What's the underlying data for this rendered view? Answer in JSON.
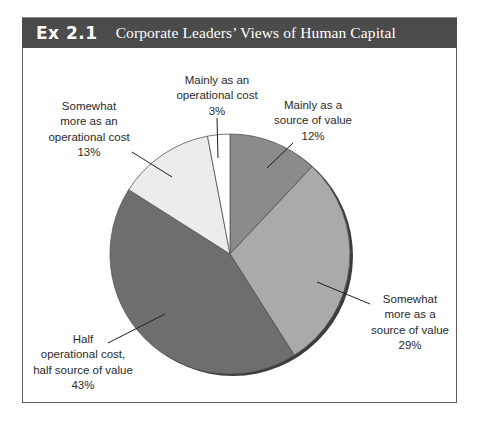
{
  "exhibit": {
    "number": "Ex 2.1",
    "title": "Corporate Leaders’ Views of Human Capital"
  },
  "chart_data": {
    "type": "pie",
    "title": "Corporate Leaders’ Views of Human Capital",
    "exhibit_number": "Ex 2.1",
    "start_angle_deg": 0,
    "direction": "clockwise",
    "legend": "none (direct labels with leader lines)",
    "slices": [
      {
        "label": "Mainly as a source of value",
        "value": 12,
        "value_label": "12%",
        "color": "#8b8b8b"
      },
      {
        "label": "Somewhat more as a source of value",
        "value": 29,
        "value_label": "29%",
        "color": "#aaaaaa"
      },
      {
        "label": "Half operational cost, half source of value",
        "value": 43,
        "value_label": "43%",
        "color": "#6e6e6e"
      },
      {
        "label": "Somewhat more as an operational cost",
        "value": 13,
        "value_label": "13%",
        "color": "#ececec"
      },
      {
        "label": "Mainly as an operational cost",
        "value": 3,
        "value_label": "3%",
        "color": "#ffffff"
      }
    ],
    "categories": [
      "Mainly as a source of value",
      "Somewhat more as a source of value",
      "Half operational cost, half source of value",
      "Somewhat more as an operational cost",
      "Mainly as an operational cost"
    ],
    "values": [
      12,
      29,
      43,
      13,
      3
    ]
  },
  "labels": {
    "mainly_cost": {
      "lines": [
        "Mainly as an",
        "operational cost",
        "3%"
      ]
    },
    "mainly_value": {
      "lines": [
        "Mainly as a",
        "source of value",
        "12%"
      ]
    },
    "somewhat_cost": {
      "lines": [
        "Somewhat",
        "more as an",
        "operational cost",
        "13%"
      ]
    },
    "half": {
      "lines": [
        "Half",
        "operational cost,",
        "half source of value",
        "43%"
      ]
    },
    "somewhat_value": {
      "lines": [
        "Somewhat",
        "more as a",
        "source of value",
        "29%"
      ]
    }
  }
}
